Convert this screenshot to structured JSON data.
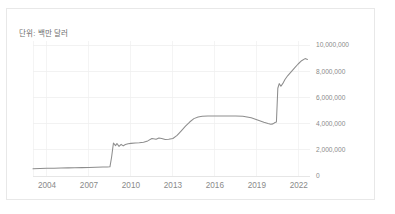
{
  "card": {
    "unit_note": "단위: 백만 달러",
    "background_color": "#ffffff",
    "border_color": "#e8e8e8"
  },
  "chart_data": {
    "type": "line",
    "title": "",
    "subtitle": "",
    "annotation": "단위: 백만 달러",
    "xlabel": "",
    "ylabel": "",
    "xlim": [
      2003,
      2022.8
    ],
    "ylim": [
      0,
      10000000
    ],
    "grid": true,
    "legend_position": "none",
    "line_color": "#8d8d8d",
    "grid_color": "#ececec",
    "tick_label_color": "#8a8a8a",
    "y_ticks": [
      0,
      2000000,
      4000000,
      6000000,
      8000000,
      10000000
    ],
    "y_tick_labels": [
      "0",
      "2,000,000",
      "4,000,000",
      "6,000,000",
      "8,000,000",
      "10,000,000"
    ],
    "x_ticks": [
      2004,
      2007,
      2010,
      2013,
      2016,
      2019,
      2022
    ],
    "x_tick_labels": [
      "2004",
      "2007",
      "2010",
      "2013",
      "2016",
      "2019",
      "2022"
    ],
    "series": [
      {
        "name": "value",
        "x": [
          2003.0,
          2003.5,
          2004.0,
          2004.5,
          2005.0,
          2005.5,
          2006.0,
          2006.5,
          2007.0,
          2007.5,
          2008.0,
          2008.3,
          2008.5,
          2008.62,
          2008.75,
          2008.9,
          2009.0,
          2009.15,
          2009.3,
          2009.45,
          2009.6,
          2009.8,
          2010.0,
          2010.3,
          2010.6,
          2010.9,
          2011.2,
          2011.5,
          2011.8,
          2012.0,
          2012.2,
          2012.45,
          2012.7,
          2013.0,
          2013.3,
          2013.6,
          2013.9,
          2014.2,
          2014.5,
          2014.8,
          2015.1,
          2015.5,
          2016.0,
          2016.5,
          2017.0,
          2017.5,
          2018.0,
          2018.3,
          2018.6,
          2018.9,
          2019.2,
          2019.5,
          2019.8,
          2020.0,
          2020.15,
          2020.3,
          2020.4,
          2020.5,
          2020.6,
          2020.72,
          2020.85,
          2021.0,
          2021.2,
          2021.45,
          2021.7,
          2021.95,
          2022.2,
          2022.45,
          2022.62
        ],
        "y": [
          560000,
          570000,
          585000,
          595000,
          610000,
          620000,
          630000,
          640000,
          655000,
          668000,
          680000,
          690000,
          700000,
          1450000,
          2520000,
          2320000,
          2480000,
          2260000,
          2420000,
          2300000,
          2400000,
          2460000,
          2490000,
          2520000,
          2540000,
          2580000,
          2680000,
          2860000,
          2800000,
          2900000,
          2860000,
          2780000,
          2800000,
          2860000,
          3100000,
          3450000,
          3800000,
          4120000,
          4380000,
          4500000,
          4560000,
          4580000,
          4585000,
          4585000,
          4585000,
          4580000,
          4560000,
          4510000,
          4440000,
          4340000,
          4220000,
          4100000,
          4000000,
          3950000,
          3980000,
          4080000,
          4120000,
          6700000,
          7050000,
          6850000,
          7050000,
          7350000,
          7650000,
          7950000,
          8250000,
          8550000,
          8800000,
          8960000,
          8900000
        ]
      }
    ]
  }
}
